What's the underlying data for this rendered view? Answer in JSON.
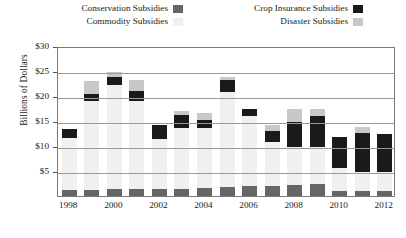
{
  "legend": {
    "rows": [
      [
        {
          "label": "Conservation Subsidies",
          "key": "conservation",
          "color": "#666666"
        },
        {
          "label": "Crop Insurance Subsidies",
          "key": "crop_insurance",
          "color": "#1a1a1a"
        }
      ],
      [
        {
          "label": "Commodity Subsidies",
          "key": "commodity",
          "color": "#f0f0f0"
        },
        {
          "label": "Disaster Subsidies",
          "key": "disaster",
          "color": "#c8c8c8"
        }
      ]
    ]
  },
  "axes": {
    "y_title": "Billions of Dollars",
    "y_ticks": [
      "$5",
      "$10",
      "$15",
      "$20",
      "$25",
      "$30"
    ],
    "x_ticks": [
      "1998",
      "2000",
      "2002",
      "2004",
      "2006",
      "2008",
      "2010",
      "2012"
    ]
  },
  "chart_data": {
    "type": "bar",
    "stacked": true,
    "title": "",
    "xlabel": "",
    "ylabel": "Billions of Dollars",
    "ylim": [
      0,
      30
    ],
    "ytick_values": [
      5,
      10,
      15,
      20,
      25,
      30
    ],
    "grid": true,
    "legend_position": "top",
    "categories": [
      "1998",
      "1999",
      "2000",
      "2001",
      "2002",
      "2003",
      "2004",
      "2005",
      "2006",
      "2007",
      "2008",
      "2009",
      "2010",
      "2011",
      "2012"
    ],
    "xtick_labels": [
      "1998",
      "",
      "2000",
      "",
      "2002",
      "",
      "2004",
      "",
      "2006",
      "",
      "2008",
      "",
      "2010",
      "",
      "2012"
    ],
    "series": [
      {
        "name": "Conservation Subsidies",
        "color": "#666666",
        "values": [
          1.6,
          1.7,
          1.8,
          1.8,
          1.8,
          1.9,
          2.0,
          2.2,
          2.4,
          2.4,
          2.6,
          2.9,
          1.4,
          1.5,
          1.5
        ]
      },
      {
        "name": "Commodity Subsidies",
        "color": "#f0f0f0",
        "values": [
          10.5,
          17.8,
          20.8,
          17.6,
          10.0,
          12.1,
          12.0,
          19.0,
          14.0,
          8.9,
          7.6,
          7.4,
          4.6,
          3.7,
          3.8
        ]
      },
      {
        "name": "Crop Insurance Subsidies",
        "color": "#1a1a1a",
        "values": [
          1.7,
          1.4,
          1.7,
          2.1,
          2.8,
          2.6,
          1.7,
          2.5,
          1.4,
          2.2,
          5.0,
          6.1,
          6.2,
          7.9,
          7.6
        ]
      },
      {
        "name": "Disaster Subsidies",
        "color": "#c8c8c8",
        "values": [
          0.0,
          2.5,
          0.9,
          2.2,
          0.0,
          0.8,
          1.3,
          0.6,
          0.0,
          1.2,
          2.7,
          1.5,
          0.0,
          1.2,
          0.0
        ]
      }
    ],
    "totals": [
      13.8,
      23.4,
      25.2,
      23.7,
      14.6,
      17.4,
      17.0,
      24.3,
      17.8,
      14.7,
      17.9,
      17.9,
      12.2,
      14.3,
      12.9
    ]
  }
}
